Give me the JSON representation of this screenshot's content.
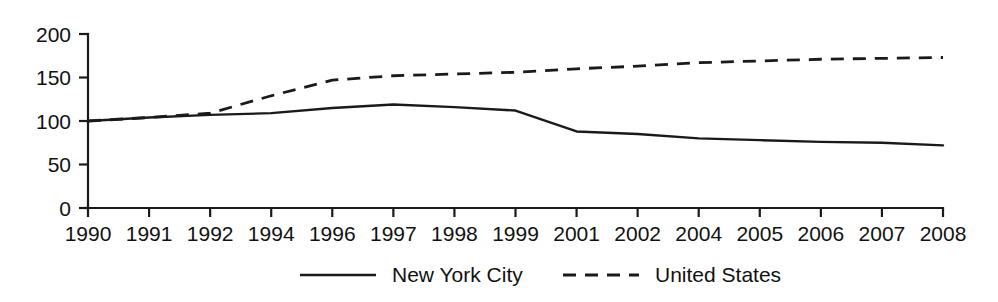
{
  "chart_data": {
    "type": "line",
    "title": "",
    "subtitle": "",
    "xlabel": "",
    "ylabel": "",
    "x": [
      "1990",
      "1991",
      "1992",
      "1994",
      "1996",
      "1997",
      "1998",
      "1999",
      "2001",
      "2002",
      "2004",
      "2005",
      "2006",
      "2007",
      "2008"
    ],
    "xtick_labels": [
      "1990",
      "1991",
      "1992",
      "1994",
      "1996",
      "1997",
      "1998",
      "1999",
      "2001",
      "2002",
      "2004",
      "2005",
      "2006",
      "2007",
      "2008"
    ],
    "ytick_labels": [
      "0",
      "50",
      "100",
      "150",
      "200"
    ],
    "ytick_values": [
      0,
      50,
      100,
      150,
      200
    ],
    "ylim": [
      0,
      200
    ],
    "grid": false,
    "legend_position": "bottom-center",
    "series": [
      {
        "name": "New York City",
        "style": "solid",
        "color": "#1a1a1a",
        "values": [
          100,
          104,
          107,
          109,
          115,
          119,
          116,
          112,
          88,
          85,
          80,
          78,
          76,
          75,
          72
        ]
      },
      {
        "name": "United States",
        "style": "dashed",
        "color": "#1a1a1a",
        "values": [
          100,
          104,
          109,
          129,
          147,
          152,
          154,
          156,
          160,
          163,
          167,
          169,
          171,
          172,
          173
        ]
      }
    ]
  },
  "legend": {
    "items": [
      {
        "label": "New York City",
        "style": "solid"
      },
      {
        "label": "United States",
        "style": "dashed"
      }
    ]
  }
}
